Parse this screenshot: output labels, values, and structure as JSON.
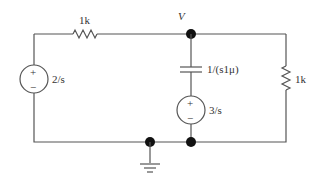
{
  "diagram": {
    "type": "circuit",
    "node_label": "V",
    "components": {
      "left_resistor": {
        "label": "1k"
      },
      "left_source": {
        "label": "2/s",
        "plus": "+",
        "minus": "−"
      },
      "capacitor": {
        "label": "1/(s1μ)"
      },
      "middle_source": {
        "label": "3/s",
        "plus": "+",
        "minus": "−"
      },
      "right_resistor": {
        "label": "1k"
      }
    },
    "colors": {
      "wire": "#555555",
      "node": "#111111",
      "text": "#333333"
    }
  }
}
